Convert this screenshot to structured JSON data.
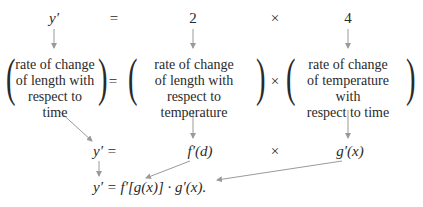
{
  "row1": {
    "lhs": "y′",
    "eq": "=",
    "val1": "2",
    "times": "×",
    "val2": "4"
  },
  "row2": {
    "block1": [
      "rate of change",
      "of length with",
      "respect to time"
    ],
    "eq": "=",
    "block2": [
      "rate of change",
      "of length with",
      "respect to temperature"
    ],
    "times": "×",
    "block3": [
      "rate of change",
      "of temperature with",
      "respect to time"
    ]
  },
  "row3": {
    "lhs": "y′ =",
    "f": "f′(d)",
    "times": "×",
    "g": "g′(x)"
  },
  "row4": {
    "formula": "y′ = f′[g(x)] · g′(x)."
  },
  "colors": {
    "text": "#2a2a2a",
    "arrow": "#9a9a9a"
  }
}
